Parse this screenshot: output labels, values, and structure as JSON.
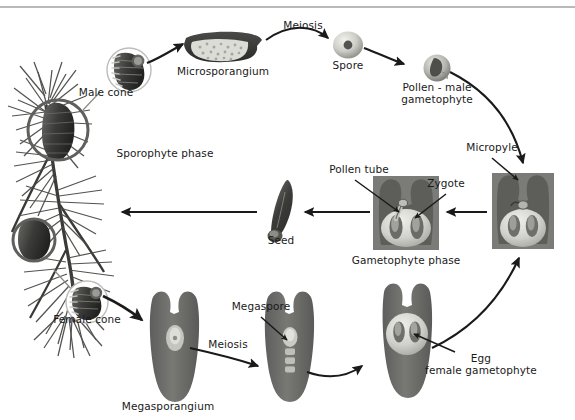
{
  "diagram": {
    "type": "biological-cycle-diagram",
    "canvas": {
      "width": 575,
      "height": 420
    },
    "background_color": "#ffffff",
    "rule_color": "#b9b9b9",
    "ink_color": "#1a1a1a",
    "structure_fill": "#6e6e6e",
    "structure_light": "#d8d8d4",
    "labels": [
      {
        "id": "meiosis-top",
        "text": "Meiosis",
        "x": 303,
        "y": 26,
        "align": "center"
      },
      {
        "id": "microsporangium",
        "text": "Microsporangium",
        "x": 223,
        "y": 72,
        "align": "center"
      },
      {
        "id": "spore",
        "text": "Spore",
        "x": 348,
        "y": 66,
        "align": "center"
      },
      {
        "id": "pollen-male",
        "text": "Pollen - male\ngametophyte",
        "x": 437,
        "y": 88,
        "align": "center"
      },
      {
        "id": "male-cone",
        "text": "Male cone",
        "x": 106,
        "y": 93,
        "align": "center"
      },
      {
        "id": "sporophyte-phase",
        "text": "Sporophyte phase",
        "x": 165,
        "y": 154,
        "align": "center"
      },
      {
        "id": "micropyle",
        "text": "Micropyle",
        "x": 492,
        "y": 148,
        "align": "center"
      },
      {
        "id": "pollen-tube",
        "text": "Pollen tube",
        "x": 359,
        "y": 170,
        "align": "center"
      },
      {
        "id": "zygote",
        "text": "Zygote",
        "x": 446,
        "y": 184,
        "align": "center"
      },
      {
        "id": "seed",
        "text": "Seed",
        "x": 281,
        "y": 241,
        "align": "center"
      },
      {
        "id": "gametophyte-phase",
        "text": "Gametophyte phase",
        "x": 406,
        "y": 261,
        "align": "center"
      },
      {
        "id": "female-cone",
        "text": "Female cone",
        "x": 87,
        "y": 320,
        "align": "center"
      },
      {
        "id": "megaspore",
        "text": "Megaspore",
        "x": 261,
        "y": 307,
        "align": "center"
      },
      {
        "id": "meiosis-bottom",
        "text": "Meiosis",
        "x": 228,
        "y": 345,
        "align": "center"
      },
      {
        "id": "egg-female",
        "text": "Egg\nfemale gametophyte",
        "x": 481,
        "y": 359,
        "align": "center"
      },
      {
        "id": "megasporangium",
        "text": "Megasporangium",
        "x": 168,
        "y": 407,
        "align": "center"
      }
    ],
    "stages": [
      {
        "id": "pine-branch",
        "name": "Sporophyte pine branch with cones"
      },
      {
        "id": "male-cone-inset",
        "name": "Male cone close-up"
      },
      {
        "id": "microsporangium-art",
        "name": "Microsporangium"
      },
      {
        "id": "spore-art",
        "name": "Spore"
      },
      {
        "id": "pollen-art",
        "name": "Pollen grain / male gametophyte"
      },
      {
        "id": "ovule-micropyle",
        "name": "Ovule showing micropyle"
      },
      {
        "id": "ovule-gametophyte",
        "name": "Ovule with pollen tube and zygote"
      },
      {
        "id": "seed-art",
        "name": "Winged seed"
      },
      {
        "id": "female-cone-inset",
        "name": "Female cone close-up"
      },
      {
        "id": "megasporangium-art",
        "name": "Megasporangium ovule"
      },
      {
        "id": "megaspore-art",
        "name": "Ovule with megaspore tetrad"
      },
      {
        "id": "egg-gametophyte-art",
        "name": "Ovule with egg / female gametophyte"
      }
    ],
    "arrows": [
      {
        "id": "male-cone-to-microsporangium",
        "from": "male-cone-inset",
        "to": "microsporangium-art"
      },
      {
        "id": "meiosis-to-spore",
        "from": "microsporangium-art",
        "to": "spore-art",
        "label": "Meiosis"
      },
      {
        "id": "spore-to-pollen",
        "from": "spore-art",
        "to": "pollen-art"
      },
      {
        "id": "pollen-to-ovule",
        "from": "pollen-art",
        "to": "ovule-micropyle"
      },
      {
        "id": "ovule-to-gametophyte",
        "from": "ovule-micropyle",
        "to": "ovule-gametophyte"
      },
      {
        "id": "gametophyte-to-seed",
        "from": "ovule-gametophyte",
        "to": "seed-art"
      },
      {
        "id": "seed-to-sporophyte",
        "from": "seed-art",
        "to": "pine-branch"
      },
      {
        "id": "female-cone-to-megasporangium",
        "from": "female-cone-inset",
        "to": "megasporangium-art"
      },
      {
        "id": "megasporangium-meiosis",
        "from": "megasporangium-art",
        "to": "megaspore-art",
        "label": "Meiosis"
      },
      {
        "id": "megaspore-to-egg",
        "from": "megaspore-art",
        "to": "egg-gametophyte-art"
      },
      {
        "id": "egg-to-ovule",
        "from": "egg-gametophyte-art",
        "to": "ovule-micropyle"
      }
    ]
  }
}
